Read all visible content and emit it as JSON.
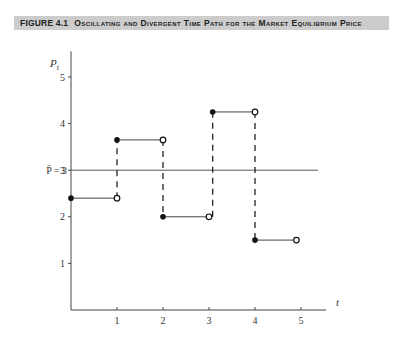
{
  "figure": {
    "number_label": "FIGURE 4.1",
    "caption": "Oscillating and Divergent Time Path for the Market Equilibrium Price"
  },
  "chart_data": {
    "type": "line",
    "title": "Oscillating and Divergent Time Path for the Market Equilibrium Price",
    "xlabel": "t",
    "ylabel": "P_t",
    "xlim": [
      0,
      5.5
    ],
    "ylim": [
      0,
      5.5
    ],
    "x_ticks": [
      "1",
      "2",
      "3",
      "4",
      "5"
    ],
    "y_ticks": [
      "1",
      "2",
      "3",
      "4",
      "5"
    ],
    "grid": false,
    "equilibrium": {
      "label": "P̄ = 3",
      "value": 3
    },
    "series": [
      {
        "name": "P_t (step path)",
        "style": "step, closed dot at start, open circle at end, dashed vertical jumps",
        "segments": [
          {
            "t_start": 0,
            "t_end": 1,
            "value": 2.4
          },
          {
            "t_start": 1,
            "t_end": 2,
            "value": 3.65
          },
          {
            "t_start": 2,
            "t_end": 3,
            "value": 2.0
          },
          {
            "t_start": 3.08,
            "t_end": 4,
            "value": 4.25
          },
          {
            "t_start": 4,
            "t_end": 4.9,
            "value": 1.5
          }
        ]
      }
    ]
  }
}
